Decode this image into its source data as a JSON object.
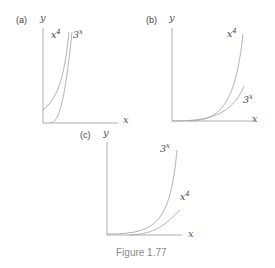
{
  "figure": {
    "caption": "Figure 1.77",
    "panels": [
      {
        "id": "a",
        "label": "(a)",
        "x_axis_label": "x",
        "y_axis_label": "y",
        "curves": [
          {
            "name": "x^4",
            "base": "x",
            "exp": "4"
          },
          {
            "name": "3^x",
            "base": "3",
            "exp": "x"
          }
        ]
      },
      {
        "id": "b",
        "label": "(b)",
        "x_axis_label": "x",
        "y_axis_label": "y",
        "curves": [
          {
            "name": "x^4",
            "base": "x",
            "exp": "4"
          },
          {
            "name": "3^x",
            "base": "3",
            "exp": "x"
          }
        ]
      },
      {
        "id": "c",
        "label": "(c)",
        "x_axis_label": "x",
        "y_axis_label": "y",
        "curves": [
          {
            "name": "3^x",
            "base": "3",
            "exp": "x"
          },
          {
            "name": "x^4",
            "base": "x",
            "exp": "4"
          }
        ]
      }
    ],
    "colors": {
      "axis": "#9a9a9a",
      "curve": "#a0a0a0",
      "text": "#444444",
      "caption": "#8a8a8a"
    }
  }
}
